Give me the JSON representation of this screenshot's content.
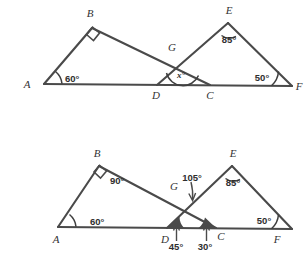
{
  "figure": {
    "stroke_color": "#4a4a4a",
    "background": "#ffffff"
  },
  "diagrams": [
    {
      "id": "top",
      "name": "unlabelled-angle-figure",
      "vertices": {
        "A": "A",
        "B": "B",
        "D": "D",
        "C": "C",
        "E": "E",
        "F": "F",
        "G": "G"
      },
      "angles": {
        "A": "60°",
        "B": "",
        "E": "85°",
        "F": "50°",
        "G": "x°"
      },
      "unknown_label": "x°",
      "has_right_angle_square_at_B": true
    },
    {
      "id": "bottom",
      "name": "solved-angle-figure",
      "vertices": {
        "A": "A",
        "B": "B",
        "D": "D",
        "C": "C",
        "E": "E",
        "F": "F",
        "G": "G"
      },
      "angles": {
        "A": "60°",
        "B": "90°",
        "E": "85°",
        "F": "50°",
        "G": "105°",
        "D": "45°",
        "C": "30°"
      },
      "has_right_angle_square_at_B": true
    }
  ]
}
